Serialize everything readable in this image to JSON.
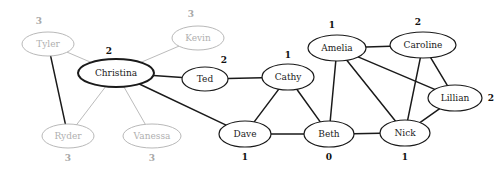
{
  "diagram": {
    "background_color": "#ffffff",
    "active_color": "#1a1a1a",
    "inactive_color": "#b0b0b0",
    "edge_active_color": "#1a1a1a",
    "edge_inactive_color": "#b3b3b3"
  },
  "chart_data": {
    "type": "diagram",
    "nodes": [
      {
        "id": "tyler",
        "label": "Tyler",
        "value": "3",
        "state": "inactive",
        "cx": 48,
        "cy": 44,
        "rx": 26,
        "ry": 12,
        "value_pos": "above",
        "value_x": 39,
        "value_y": 21
      },
      {
        "id": "kevin",
        "label": "Kevin",
        "value": "3",
        "state": "inactive",
        "cx": 198,
        "cy": 38,
        "rx": 26,
        "ry": 12,
        "value_pos": "above",
        "value_x": 191,
        "value_y": 14
      },
      {
        "id": "christina",
        "label": "Christina",
        "value": "2",
        "state": "active",
        "cx": 116,
        "cy": 73,
        "rx": 38,
        "ry": 14,
        "value_pos": "above",
        "value_x": 109,
        "value_y": 51
      },
      {
        "id": "ted",
        "label": "Ted",
        "value": "2",
        "state": "active",
        "cx": 205,
        "cy": 79,
        "rx": 23,
        "ry": 12,
        "value_pos": "above",
        "value_x": 224,
        "value_y": 60
      },
      {
        "id": "cathy",
        "label": "Cathy",
        "value": "1",
        "state": "active",
        "cx": 288,
        "cy": 77,
        "rx": 26,
        "ry": 13,
        "value_pos": "above",
        "value_x": 288,
        "value_y": 55
      },
      {
        "id": "ryder",
        "label": "Ryder",
        "value": "3",
        "state": "inactive",
        "cx": 68,
        "cy": 136,
        "rx": 26,
        "ry": 12,
        "value_pos": "below",
        "value_x": 68,
        "value_y": 158
      },
      {
        "id": "vanessa",
        "label": "Vanessa",
        "value": "3",
        "state": "inactive",
        "cx": 152,
        "cy": 136,
        "rx": 29,
        "ry": 12,
        "value_pos": "below",
        "value_x": 152,
        "value_y": 158
      },
      {
        "id": "dave",
        "label": "Dave",
        "value": "1",
        "state": "active",
        "cx": 245,
        "cy": 134,
        "rx": 26,
        "ry": 13,
        "value_pos": "below",
        "value_x": 245,
        "value_y": 157
      },
      {
        "id": "beth",
        "label": "Beth",
        "value": "0",
        "state": "active",
        "cx": 329,
        "cy": 134,
        "rx": 25,
        "ry": 13,
        "value_pos": "below",
        "value_x": 329,
        "value_y": 157
      },
      {
        "id": "nick",
        "label": "Nick",
        "value": "1",
        "state": "active",
        "cx": 405,
        "cy": 133,
        "rx": 25,
        "ry": 13,
        "value_pos": "below",
        "value_x": 405,
        "value_y": 157
      },
      {
        "id": "amelia",
        "label": "Amelia",
        "value": "1",
        "state": "active",
        "cx": 337,
        "cy": 48,
        "rx": 29,
        "ry": 13,
        "value_pos": "above",
        "value_x": 332,
        "value_y": 25
      },
      {
        "id": "caroline",
        "label": "Caroline",
        "value": "2",
        "state": "active",
        "cx": 423,
        "cy": 45,
        "rx": 33,
        "ry": 13,
        "value_pos": "above",
        "value_x": 418,
        "value_y": 22
      },
      {
        "id": "lillian",
        "label": "Lillian",
        "value": "2",
        "state": "active",
        "cx": 455,
        "cy": 98,
        "rx": 27,
        "ry": 13,
        "value_pos": "right",
        "value_x": 491,
        "value_y": 98
      }
    ],
    "edges": [
      {
        "source": "tyler",
        "target": "christina",
        "state": "inactive"
      },
      {
        "source": "tyler",
        "target": "ryder",
        "state": "active"
      },
      {
        "source": "kevin",
        "target": "christina",
        "state": "inactive"
      },
      {
        "source": "christina",
        "target": "ryder",
        "state": "inactive"
      },
      {
        "source": "christina",
        "target": "vanessa",
        "state": "inactive"
      },
      {
        "source": "christina",
        "target": "ted",
        "state": "active"
      },
      {
        "source": "christina",
        "target": "dave",
        "state": "active"
      },
      {
        "source": "ted",
        "target": "cathy",
        "state": "active"
      },
      {
        "source": "cathy",
        "target": "dave",
        "state": "active"
      },
      {
        "source": "cathy",
        "target": "beth",
        "state": "active"
      },
      {
        "source": "dave",
        "target": "beth",
        "state": "active"
      },
      {
        "source": "beth",
        "target": "nick",
        "state": "active"
      },
      {
        "source": "beth",
        "target": "amelia",
        "state": "active"
      },
      {
        "source": "amelia",
        "target": "caroline",
        "state": "active"
      },
      {
        "source": "amelia",
        "target": "nick",
        "state": "active"
      },
      {
        "source": "amelia",
        "target": "lillian",
        "state": "active"
      },
      {
        "source": "caroline",
        "target": "nick",
        "state": "active"
      },
      {
        "source": "caroline",
        "target": "lillian",
        "state": "active"
      },
      {
        "source": "lillian",
        "target": "nick",
        "state": "active"
      }
    ]
  }
}
